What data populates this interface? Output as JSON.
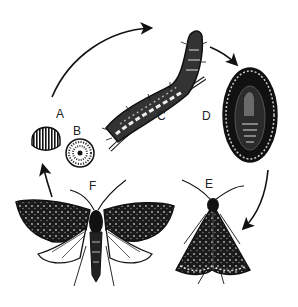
{
  "diagram": {
    "type": "life-cycle",
    "stages": [
      {
        "id": "A",
        "label": "A",
        "name": "egg (side view)"
      },
      {
        "id": "B",
        "label": "B",
        "name": "egg (top view)"
      },
      {
        "id": "C",
        "label": "C",
        "name": "larva / caterpillar"
      },
      {
        "id": "D",
        "label": "D",
        "name": "pupa in cocoon"
      },
      {
        "id": "E",
        "label": "E",
        "name": "adult moth (wings folded)"
      },
      {
        "id": "F",
        "label": "F",
        "name": "adult moth (wings spread)"
      }
    ],
    "arrows": [
      {
        "from": "A",
        "to": "C"
      },
      {
        "from": "C",
        "to": "D"
      },
      {
        "from": "D",
        "to": "E"
      },
      {
        "from": "F",
        "to": "A"
      }
    ],
    "colors": {
      "ink": "#111111",
      "background": "#ffffff",
      "label": "#222222"
    }
  }
}
